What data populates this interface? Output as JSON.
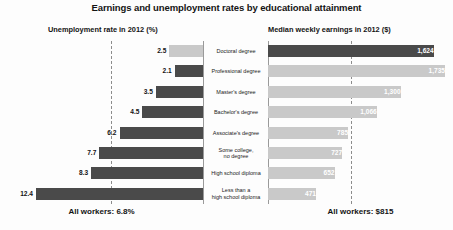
{
  "chart_data": {
    "type": "bar",
    "title": "Earnings and unemployment rates by educational attainment",
    "orientation": "horizontal-diverging",
    "grid": false,
    "legend": "none",
    "categories": [
      "Doctoral degree",
      "Professional degree",
      "Master's degree",
      "Bachelor's degree",
      "Associate's degree",
      "Some college,\nno degree",
      "High school diploma",
      "Less than a\nhigh school diploma"
    ],
    "panels": [
      {
        "key": "unemployment",
        "header": "Unemployment rate in 2012 (%)",
        "direction": "left",
        "xlabel": "",
        "ylabel": "",
        "values": [
          2.5,
          2.1,
          3.5,
          4.5,
          6.2,
          7.7,
          8.3,
          12.4
        ],
        "value_labels": [
          "2.5",
          "2.1",
          "3.5",
          "4.5",
          "6.2",
          "7.7",
          "8.3",
          "12.4"
        ],
        "xlim": [
          0,
          15
        ],
        "reference_line": {
          "value": 6.8,
          "label": "All workers: 6.8%"
        }
      },
      {
        "key": "earnings",
        "header": "Median weekly earnings in 2012 ($)",
        "direction": "right",
        "xlabel": "",
        "ylabel": "",
        "values": [
          1624,
          1735,
          1300,
          1066,
          785,
          727,
          652,
          471
        ],
        "value_labels": [
          "1,624",
          "1,735",
          "1,300",
          "1,066",
          "785",
          "727",
          "652",
          "471"
        ],
        "xlim": [
          0,
          1900
        ],
        "reference_line": {
          "value": 815,
          "label": "All workers: $815"
        }
      }
    ],
    "colors": {
      "bar_dark": "#4a4a4a",
      "bar_light": "#c9c9c9",
      "reference_line": "#8c8c8c",
      "axis": "#9a9a9a",
      "text": "#141414",
      "background": "#fdfdfd"
    }
  }
}
